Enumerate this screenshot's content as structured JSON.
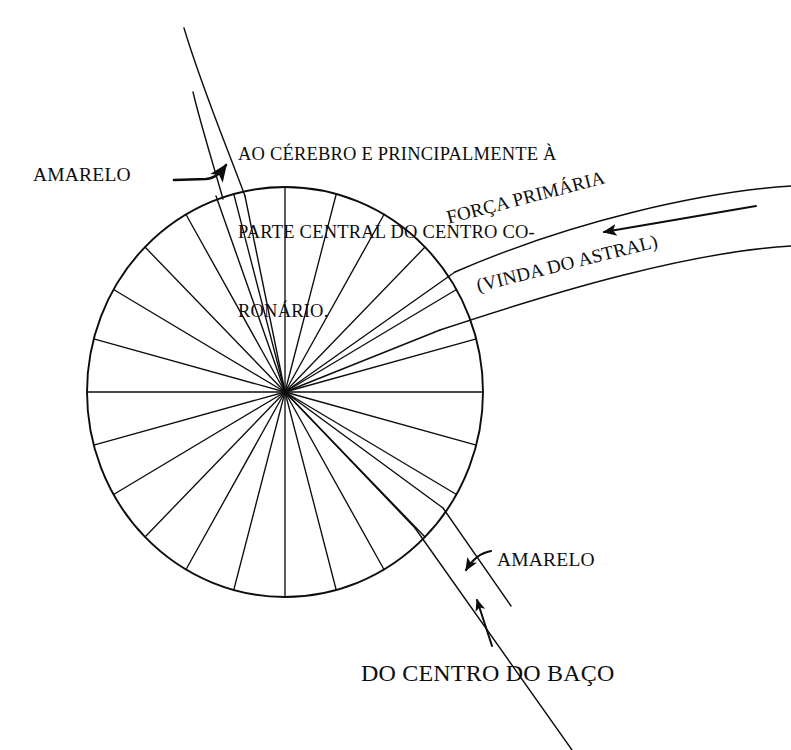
{
  "diagram": {
    "background_color": "#ffffff",
    "ink_color": "#0d0d0d"
  },
  "wheel": {
    "name": "chakra-wheel",
    "center_x": 285,
    "center_y": 392,
    "radius_x": 198,
    "radius_y": 205,
    "spoke_count": 24,
    "spoke_step_degrees": 15,
    "stroke_width": 1.6
  },
  "labels": {
    "amarelo_top": "AMARELO",
    "brain_note_line1": "AO CÉREBRO E PRINCIPALMENTE À",
    "brain_note_line2": "PARTE CENTRAL DO CENTRO CO-",
    "brain_note_line3": "RONÁRIO.",
    "forca_primaria": "FORÇA PRIMÁRIA",
    "vinda_do_astral": "(VINDA DO ASTRAL)",
    "amarelo_bottom": "AMARELO",
    "do_centro_do_baco": "DO CENTRO DO BAÇO"
  },
  "channels": [
    {
      "name": "top-yellow-channel",
      "label": "AMARELO",
      "direction": "up-left from wheel top toward brain"
    },
    {
      "name": "right-primary-force-channel",
      "label": "FORÇA PRIMÁRIA (VINDA DO ASTRAL)",
      "direction": "incoming from upper right toward wheel hub"
    },
    {
      "name": "bottom-right-yellow-channel",
      "label": "AMARELO / DO CENTRO DO BAÇO",
      "direction": "incoming from lower right toward wheel"
    }
  ],
  "arrows": [
    {
      "name": "amarelo-top-pointer",
      "style": "thin-curved-with-solid-head",
      "points_to": "top-yellow-channel"
    },
    {
      "name": "forca-primaria-flow-arrow",
      "style": "thin-straight-with-solid-head",
      "direction": "leftward",
      "points_to": "wheel-hub"
    },
    {
      "name": "amarelo-bottom-pointer",
      "style": "thin-curved-with-solid-head",
      "points_to": "bottom-right-yellow-channel"
    },
    {
      "name": "baco-flow-arrow",
      "style": "thin-straight-with-solid-head",
      "direction": "up-left",
      "points_to": "wheel-edge"
    }
  ]
}
